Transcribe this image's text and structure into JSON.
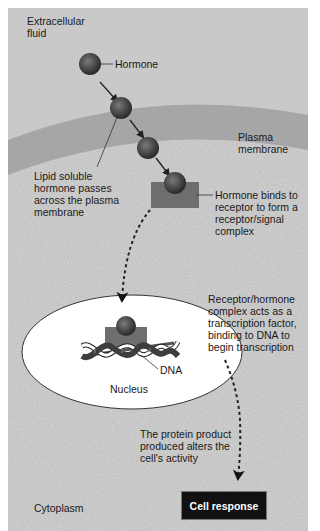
{
  "regions": {
    "extracellular": "Extracellular\nfluid",
    "plasma_membrane": "Plasma\nmembrane",
    "cytoplasm": "Cytoplasm",
    "nucleus": "Nucleus"
  },
  "labels": {
    "hormone": "Hormone",
    "lipid_soluble": "Lipid soluble\nhormone passes\nacross the plasma\nmembrane",
    "binds_receptor": "Hormone binds to\nreceptor to form a\nreceptor/signal\ncomplex",
    "transcription_factor": "Receptor/hormone\ncomplex acts as a\ntranscription factor,\nbinding to DNA to\nbegin transcription",
    "dna": "DNA",
    "protein_product": "The protein product\nproduced alters the\ncell's activity",
    "cell_response": "Cell response"
  },
  "colors": {
    "extracellular_bg": "#c9c9c9",
    "membrane": "#a3a3a3",
    "cytoplasm_bg": "#d4d4d4",
    "nucleus_fill": "#ffffff",
    "receptor": "#6e6e6e",
    "hormone": "#4a4a4a",
    "response_box": "#111111"
  }
}
